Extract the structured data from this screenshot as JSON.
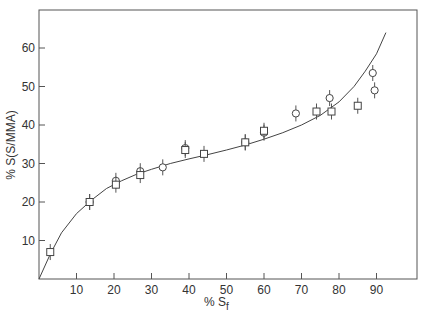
{
  "chart_data": {
    "type": "scatter",
    "title": "",
    "xlabel": "% S_f",
    "ylabel": "% S (S/MMA)",
    "xlim": [
      0,
      100
    ],
    "ylim": [
      0,
      70
    ],
    "xticks": [
      10,
      20,
      30,
      40,
      50,
      60,
      70,
      80,
      90
    ],
    "yticks": [
      10,
      20,
      30,
      40,
      50,
      60
    ],
    "grid": false,
    "legend": null,
    "series": [
      {
        "name": "circles",
        "marker": "circle",
        "x": [
          13.5,
          20.5,
          27,
          33,
          39,
          55,
          60,
          68.5,
          77.5,
          89,
          89.5
        ],
        "y": [
          20,
          25.5,
          28,
          29,
          34,
          35.5,
          38,
          43,
          47,
          53.5,
          49
        ]
      },
      {
        "name": "squares",
        "marker": "square",
        "x": [
          3,
          13.5,
          20.5,
          27,
          39,
          44,
          55,
          60,
          74,
          78,
          85
        ],
        "y": [
          7,
          20,
          24.5,
          27,
          33.5,
          32.5,
          35.5,
          38.5,
          43.5,
          43.5,
          45
        ]
      },
      {
        "name": "fitted curve",
        "marker": "line",
        "x": [
          0,
          3,
          6,
          10,
          14,
          18,
          22,
          26,
          30,
          35,
          40,
          45,
          50,
          55,
          60,
          65,
          70,
          75,
          80,
          84,
          87,
          90,
          92.5
        ],
        "y": [
          0,
          6.5,
          12,
          17,
          20.5,
          23.5,
          25.5,
          27.2,
          28.5,
          30,
          31.2,
          32.3,
          33.5,
          34.8,
          36.3,
          38,
          40,
          42.5,
          46,
          50,
          54,
          58.5,
          64
        ]
      }
    ]
  },
  "axes": {
    "xlabel_main": "% S",
    "xlabel_sub": "f",
    "ylabel": "% S(S/MMA)",
    "xtick_labels": [
      "10",
      "20",
      "30",
      "40",
      "50",
      "60",
      "70",
      "80",
      "90"
    ],
    "ytick_labels": [
      "10",
      "20",
      "30",
      "40",
      "50",
      "60"
    ]
  }
}
